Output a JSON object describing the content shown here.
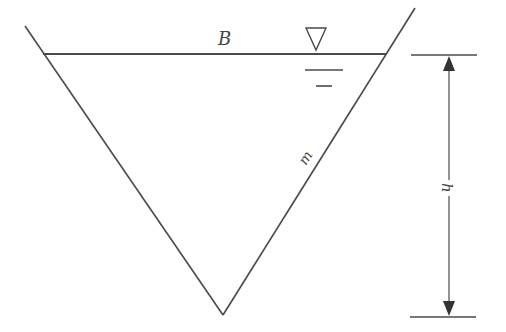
{
  "diagram": {
    "type": "triangular-channel-cross-section",
    "labels": {
      "top_width": "B",
      "side_slope": "m",
      "depth": "h"
    },
    "symbols": {
      "water_surface": "water-surface-triangle-icon"
    },
    "colors": {
      "line": "#4a4a4a",
      "background": "#ffffff"
    }
  }
}
